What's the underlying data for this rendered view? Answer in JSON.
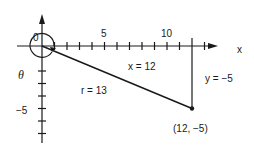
{
  "diagram": {
    "type": "coordinate-plane",
    "origin_label": "0",
    "x_axis_label": "x",
    "x_tick_labels": [
      "5",
      "10"
    ],
    "y_tick_labels": [
      "−5"
    ],
    "angle_label": "θ",
    "segments": {
      "radius_label": "r = 13",
      "x_leg_label": "x = 12",
      "y_leg_label": "y = −5"
    },
    "point": {
      "label": "(12, −5)",
      "x": 12,
      "y": -5
    },
    "colors": {
      "ink": "#1a1a1a",
      "background": "#ffffff"
    }
  }
}
